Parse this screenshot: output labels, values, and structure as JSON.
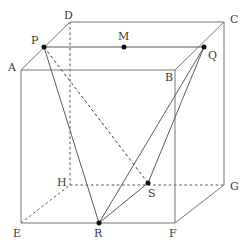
{
  "figure": {
    "kind": "cube-with-inscribed-segments",
    "width": 249,
    "height": 249,
    "background": "#ffffff",
    "stroke_solid": "#777777",
    "stroke_hidden": "#555555",
    "label_color": "#3a3a3a",
    "dot_color": "#111111"
  },
  "points": {
    "A": {
      "label": "A",
      "x": 21,
      "y": 70,
      "label_x": 8,
      "label_y": 62,
      "dot": false,
      "hidden": false
    },
    "B": {
      "label": "B",
      "x": 175,
      "y": 70,
      "label_x": 165,
      "label_y": 72,
      "dot": false,
      "hidden": false
    },
    "C": {
      "label": "C",
      "x": 224,
      "y": 22,
      "label_x": 230,
      "label_y": 14,
      "dot": false,
      "hidden": false
    },
    "D": {
      "label": "D",
      "x": 70,
      "y": 22,
      "label_x": 64,
      "label_y": 10,
      "dot": false,
      "hidden": false
    },
    "E": {
      "label": "E",
      "x": 21,
      "y": 223,
      "label_x": 13,
      "label_y": 228,
      "dot": false,
      "hidden": false
    },
    "F": {
      "label": "F",
      "x": 175,
      "y": 223,
      "label_x": 169,
      "label_y": 228,
      "dot": false,
      "hidden": false
    },
    "G": {
      "label": "G",
      "x": 224,
      "y": 185,
      "label_x": 230,
      "label_y": 181,
      "dot": false,
      "hidden": false
    },
    "H": {
      "label": "H",
      "x": 70,
      "y": 185,
      "label_x": 57,
      "label_y": 177,
      "dot": false,
      "hidden": true
    },
    "P": {
      "label": "P",
      "x": 44,
      "y": 47,
      "label_x": 31,
      "label_y": 35,
      "dot": true,
      "hidden": false
    },
    "Q": {
      "label": "Q",
      "x": 204,
      "y": 47,
      "label_x": 208,
      "label_y": 50,
      "dot": true,
      "hidden": false
    },
    "M": {
      "label": "M",
      "x": 124,
      "y": 47,
      "label_x": 118,
      "label_y": 31,
      "dot": true,
      "hidden": false
    },
    "R": {
      "label": "R",
      "x": 99,
      "y": 223,
      "label_x": 94,
      "label_y": 228,
      "dot": true,
      "hidden": false
    },
    "S": {
      "label": "S",
      "x": 148,
      "y": 183,
      "label_x": 148,
      "label_y": 188,
      "dot": true,
      "hidden": false
    }
  },
  "edges": {
    "solid": [
      {
        "name": "edge-AB",
        "from": "A",
        "to": "B"
      },
      {
        "name": "edge-BC",
        "from": "B",
        "to": "C"
      },
      {
        "name": "edge-CD",
        "from": "C",
        "to": "D"
      },
      {
        "name": "edge-DA",
        "from": "D",
        "to": "A"
      },
      {
        "name": "edge-EF",
        "from": "E",
        "to": "F"
      },
      {
        "name": "edge-FG",
        "from": "F",
        "to": "G"
      },
      {
        "name": "edge-AE",
        "from": "A",
        "to": "E"
      },
      {
        "name": "edge-BF",
        "from": "B",
        "to": "F"
      },
      {
        "name": "edge-CG",
        "from": "C",
        "to": "G"
      }
    ],
    "hidden": [
      {
        "name": "edge-EH",
        "from": "E",
        "to": "H"
      },
      {
        "name": "edge-HG",
        "from": "H",
        "to": "G"
      },
      {
        "name": "edge-DH",
        "from": "D",
        "to": "H"
      }
    ]
  },
  "segments": {
    "solid": [
      {
        "name": "segment-PQ",
        "from": "P",
        "to": "Q"
      },
      {
        "name": "segment-PR",
        "from": "P",
        "to": "R"
      },
      {
        "name": "segment-QR",
        "from": "Q",
        "to": "R"
      },
      {
        "name": "segment-QS",
        "from": "Q",
        "to": "S"
      },
      {
        "name": "segment-RS",
        "from": "R",
        "to": "S"
      }
    ],
    "hidden": [
      {
        "name": "segment-PS",
        "from": "P",
        "to": "S"
      }
    ]
  }
}
